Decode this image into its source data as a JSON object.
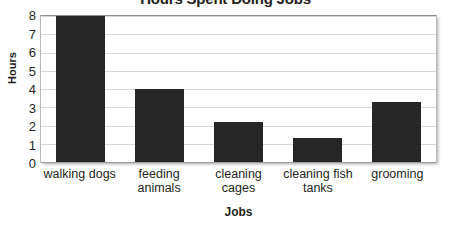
{
  "chart_data": {
    "type": "bar",
    "title": "Hours Spent Doing Jobs",
    "xlabel": "Jobs",
    "ylabel": "Hours",
    "categories": [
      "walking dogs",
      "feeding animals",
      "cleaning cages",
      "cleaning fish tanks",
      "grooming"
    ],
    "values": [
      8,
      4,
      2.2,
      1.3,
      3.3
    ],
    "ylim": [
      0,
      8
    ],
    "yticks": [
      8,
      7,
      6,
      5,
      4,
      3,
      2,
      1,
      0
    ],
    "grid": "horizontal",
    "legend": "none",
    "bar_color": "#262626",
    "gridline_color": "#d6d7d9",
    "axis_color": "#9a9c9e",
    "text_color": "#231f20"
  }
}
